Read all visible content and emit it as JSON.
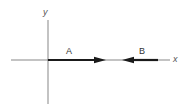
{
  "diagram": {
    "type": "vector-diagram",
    "axes": {
      "x_label": "x",
      "y_label": "y",
      "color": "#555555"
    },
    "vectors": [
      {
        "label": "A",
        "direction": "+x",
        "from_x": 48,
        "to_x": 104,
        "color": "#1a1a1a"
      },
      {
        "label": "B",
        "direction": "-x",
        "from_x": 158,
        "to_x": 124,
        "color": "#1a1a1a"
      }
    ]
  }
}
